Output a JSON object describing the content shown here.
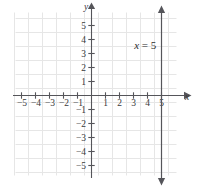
{
  "figure": {
    "title": "",
    "background_color": "#ffffff"
  },
  "chart_data": {
    "type": "line",
    "title": "",
    "xlabel": "x",
    "ylabel": "y",
    "xlim": [
      -6,
      6.3
    ],
    "ylim": [
      -6,
      6.3
    ],
    "grid": true,
    "grid_color": "#e6e6e6",
    "axis_color": "#55555a",
    "series": [
      {
        "name": "x = 5",
        "equation": "x = 5",
        "kind": "vertical-line",
        "x_value": 5,
        "color": "#55555a",
        "arrows": [
          "up",
          "down"
        ],
        "y_extent": [
          -5.9,
          5.9
        ],
        "label_text_var": "x",
        "label_text_rest": " = 5",
        "label_x": 3.05,
        "label_y": 3.35
      }
    ],
    "x_ticks": [
      -5,
      -4,
      -3,
      -2,
      -1,
      1,
      2,
      3,
      4,
      5
    ],
    "x_tick_labels": [
      "−5",
      "−4",
      "−3",
      "−2",
      "−1",
      "1",
      "2",
      "3",
      "4",
      "5"
    ],
    "y_ticks": [
      5,
      4,
      3,
      2,
      1,
      -1,
      -2,
      -3,
      -4,
      -5
    ],
    "y_tick_labels": [
      "5",
      "4",
      "3",
      "2",
      "1",
      "−1",
      "−2",
      "−3",
      "−4",
      "−5"
    ],
    "axis_labels": {
      "x": "x",
      "y": "y"
    }
  }
}
